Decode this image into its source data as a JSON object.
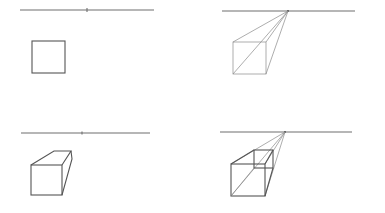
{
  "steps": [
    {
      "id": "step-1",
      "description": "Horizon line with vanishing point and a front square",
      "elements": [
        "horizon-line",
        "vanishing-point",
        "front-square"
      ]
    },
    {
      "id": "step-2",
      "description": "Connect square corners to the vanishing point",
      "elements": [
        "horizon-line",
        "vanishing-point",
        "front-square",
        "convergence-lines"
      ]
    },
    {
      "id": "step-3",
      "description": "Finished solid box with hidden lines removed",
      "elements": [
        "horizon-line",
        "vanishing-point",
        "box-front",
        "box-top",
        "box-side"
      ]
    },
    {
      "id": "step-4",
      "description": "Transparent box showing back face and convergence lines",
      "elements": [
        "horizon-line",
        "vanishing-point",
        "front-square",
        "back-square",
        "convergence-lines"
      ]
    }
  ],
  "colors": {
    "background": "#ffffff",
    "line": "#555555",
    "guide": "#8a8a8a"
  }
}
